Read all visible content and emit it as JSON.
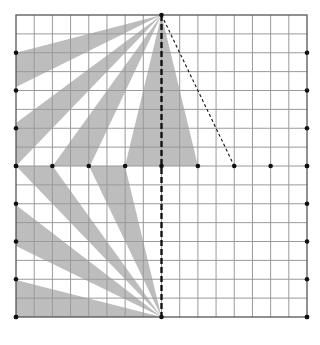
{
  "diagram": {
    "type": "grid-wedge-construction",
    "grid": {
      "cols": 16,
      "rows": 16,
      "left": 16,
      "top": 15,
      "right": 307,
      "bottom": 317,
      "line_color": "#9a9a9a",
      "border_color": "#555555"
    },
    "colors": {
      "wedge_fill": "#bdbdbd",
      "dot": "#111111",
      "dashed_line": "#111111"
    },
    "apexes": {
      "top": [
        161.5,
        15
      ],
      "bottom": [
        161.5,
        317
      ]
    },
    "wedges": [
      {
        "name": "top-wedge-1",
        "apex": "top",
        "points": [
          [
            16,
            52.75
          ],
          [
            16,
            87
          ]
        ]
      },
      {
        "name": "top-wedge-2",
        "apex": "top",
        "points": [
          [
            16,
            123
          ],
          [
            16,
            166
          ]
        ]
      },
      {
        "name": "top-wedge-3",
        "apex": "top",
        "points": [
          [
            52.6,
            166
          ],
          [
            90,
            166
          ]
        ]
      },
      {
        "name": "top-wedge-4",
        "apex": "top",
        "points": [
          [
            125,
            166
          ],
          [
            198,
            166
          ]
        ]
      },
      {
        "name": "bottom-wedge-1",
        "apex": "bottom",
        "points": [
          [
            16,
            166
          ],
          [
            52.6,
            166
          ]
        ]
      },
      {
        "name": "bottom-wedge-2",
        "apex": "bottom",
        "points": [
          [
            89,
            166
          ],
          [
            125,
            166
          ]
        ]
      },
      {
        "name": "bottom-wedge-3",
        "apex": "bottom",
        "points": [
          [
            16,
            205
          ],
          [
            16,
            246
          ]
        ]
      },
      {
        "name": "bottom-wedge-4",
        "apex": "bottom",
        "points": [
          [
            16,
            280
          ],
          [
            16,
            317
          ]
        ]
      }
    ],
    "lines": [
      {
        "name": "vertical-dashed-line",
        "from": [
          161.5,
          15
        ],
        "to": [
          161.5,
          317
        ],
        "style": "thick-dashed"
      },
      {
        "name": "diagonal-dotted-line",
        "from": [
          161.5,
          15
        ],
        "to": [
          234.25,
          166
        ],
        "style": "thin-dotted"
      }
    ],
    "dots": {
      "left_edge_rows": [
        2,
        4,
        6,
        8,
        10,
        12,
        14,
        16
      ],
      "right_edge_rows": [
        2,
        4,
        6,
        8,
        10,
        12,
        14,
        16
      ],
      "middle_row_cols": [
        0,
        2,
        4,
        6,
        8,
        10,
        12,
        14,
        16
      ],
      "top_edge_cols": [
        8
      ],
      "bottom_edge_cols": [
        0,
        8,
        16
      ]
    }
  }
}
